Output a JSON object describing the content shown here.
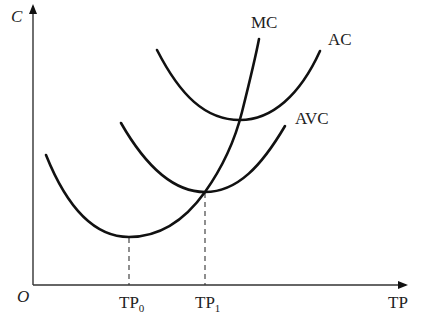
{
  "diagram": {
    "type": "cost curves",
    "axes": {
      "y_label": "C",
      "x_label": "TP",
      "origin_label": "O"
    },
    "curves": [
      {
        "name": "MC",
        "label": "MC",
        "description": "Marginal cost, U-shaped, passes through minimum of AVC and AC"
      },
      {
        "name": "AC",
        "label": "AC",
        "description": "Average cost, U-shaped, highest"
      },
      {
        "name": "AVC",
        "label": "AVC",
        "description": "Average variable cost, U-shaped, below AC"
      }
    ],
    "ticks": [
      {
        "base": "TP",
        "sub": "0",
        "description": "Output at minimum of MC"
      },
      {
        "base": "TP",
        "sub": "1",
        "description": "Output where MC crosses minimum of AVC"
      }
    ],
    "colors": {
      "curve": "#111111",
      "axis": "#333333",
      "background": "#ffffff"
    }
  }
}
